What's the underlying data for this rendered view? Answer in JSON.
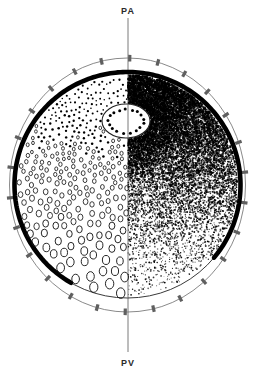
{
  "figure": {
    "name": "polar-axis-circle-diagram",
    "type": "schematic-cross-section",
    "background_color": "#ffffff",
    "ink_color": "#000000",
    "axis_line_color": "#7a7a7a",
    "outline_color": "#555555"
  },
  "axis": {
    "name": "vertical-axis",
    "top_label": "PA",
    "bottom_label": "PV",
    "x": 128,
    "y_top": 18,
    "y_bottom": 352,
    "stroke_width": 1,
    "color": "#7a7a7a"
  },
  "outer_ring": {
    "name": "outer-thin-circle",
    "cx": 127.5,
    "cy": 185,
    "rx": 118,
    "ry": 127,
    "stroke": "#6b6b6b",
    "stroke_width": 0.8,
    "tick_count": 26,
    "tick_length": 7,
    "tick_width": 3.2
  },
  "inner_ring": {
    "name": "main-circle-boundary",
    "cx": 127.5,
    "cy": 185,
    "r": 113,
    "thick_arc_start_deg": 120,
    "thick_arc_end_deg": 400,
    "thick_stroke_width": 4.6,
    "thin_stroke_width": 1.0,
    "stroke": "#000000"
  },
  "optic_disc": {
    "name": "central-ellipse-optic-disc",
    "cx": 126,
    "cy": 121,
    "rx": 24,
    "ry": 17,
    "stroke": "#222222",
    "stroke_width": 1.1,
    "fill": "#ffffff",
    "rim_dot_count": 17,
    "rim_dot_radius": 1.5
  },
  "left_hemifield": {
    "name": "left-half-ring-markers",
    "description": "Open circle markers increasing in size and density toward the inferior-nasal quadrant; small filled dots superiorly.",
    "marker_style": "open-ring",
    "min_radius": 1.0,
    "max_radius": 5.2,
    "gradient_direction": "top-to-bottom-left"
  },
  "right_hemifield": {
    "name": "right-half-stipple-field",
    "description": "Stipple density gradient, densest superiorly and around the disc, sparsest inferiorly.",
    "marker_style": "stipple-dot",
    "max_density": 1.0,
    "min_density": 0.09
  },
  "legend": {
    "visible": false
  },
  "chart_data": {
    "type": "scatter",
    "title": "",
    "xlabel": "",
    "ylabel": "",
    "annotations": [
      "PA",
      "PV"
    ]
  }
}
